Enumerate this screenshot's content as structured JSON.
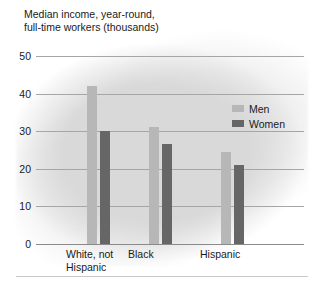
{
  "chart_data": {
    "type": "bar",
    "title": "Median income, year-round,\nfull-time workers (thousands)",
    "xlabel": "",
    "ylabel": "",
    "ylim": [
      0,
      50
    ],
    "yticks": [
      0,
      10,
      20,
      30,
      40,
      50
    ],
    "ytick_labels": [
      "0",
      "10",
      "20",
      "30",
      "40",
      "50"
    ],
    "grid": true,
    "legend_position": "upper right",
    "categories": [
      "White, not\nHispanic",
      "Black",
      "Hispanic"
    ],
    "series": [
      {
        "name": "Men",
        "color": "#b7b7b7",
        "values": [
          42,
          31,
          24.5
        ]
      },
      {
        "name": "Women",
        "color": "#666666",
        "values": [
          30,
          26.5,
          21
        ]
      }
    ]
  },
  "legend": {
    "items": [
      {
        "label": "Men",
        "color": "#b7b7b7"
      },
      {
        "label": "Women",
        "color": "#666666"
      }
    ]
  },
  "colors": {
    "men": "#b7b7b7",
    "women": "#666666",
    "gridline": "#a6a6a6",
    "background": "#d9d9d9",
    "text": "#1a1a1a"
  }
}
